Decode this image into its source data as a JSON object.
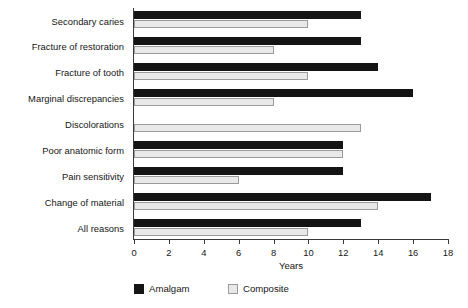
{
  "chart_data": {
    "type": "bar",
    "orientation": "horizontal",
    "title": "",
    "xlabel": "Years",
    "ylabel": "",
    "xlim": [
      0,
      18
    ],
    "xticks": [
      0,
      2,
      4,
      6,
      8,
      10,
      12,
      14,
      16,
      18
    ],
    "grid": false,
    "legend_position": "bottom-left",
    "categories": [
      "Secondary caries",
      "Fracture of restoration",
      "Fracture of tooth",
      "Marginal discrepancies",
      "Discolorations",
      "Poor anatomic form",
      "Pain sensitivity",
      "Change of material",
      "All reasons"
    ],
    "series": [
      {
        "name": "Amalgam",
        "color": "#141414",
        "values": [
          13,
          13,
          14,
          16,
          null,
          12,
          12,
          17,
          13
        ]
      },
      {
        "name": "Composite",
        "color": "#e9e9e9",
        "values": [
          10,
          8,
          10,
          8,
          13,
          12,
          6,
          14,
          10
        ]
      }
    ]
  },
  "axis": {
    "x_label": "Years",
    "tick_labels": [
      "0",
      "2",
      "4",
      "6",
      "8",
      "10",
      "12",
      "14",
      "16",
      "18"
    ]
  },
  "legend": {
    "items": [
      {
        "label": "Amalgam",
        "swatch": "black-square-icon"
      },
      {
        "label": "Composite",
        "swatch": "light-square-icon"
      }
    ]
  }
}
